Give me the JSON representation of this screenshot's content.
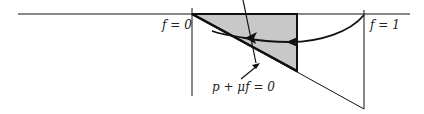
{
  "diagram": {
    "labels": {
      "f0": "f = 0",
      "f1": "f = 1",
      "line": "p + μf = 0"
    },
    "colors": {
      "stroke": "#111111",
      "fill": "#c8c8c8",
      "background": "#ffffff"
    }
  }
}
